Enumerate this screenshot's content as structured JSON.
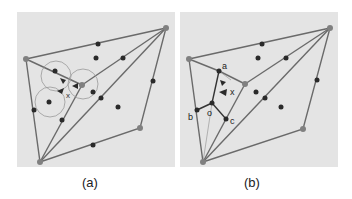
{
  "figure": {
    "background": "#ffffff",
    "panel_bg": "#e4e4e4",
    "line_color": "#6a6a6a",
    "dot_color": "#2a2a2a",
    "vertex_color": "#808080",
    "panels": [
      {
        "id": "a",
        "caption": "(a)",
        "marker_label": "x",
        "circles": [
          [
            56,
            76,
            15
          ],
          [
            83,
            84,
            15
          ],
          [
            50,
            102,
            15
          ]
        ]
      },
      {
        "id": "b",
        "caption": "(b)",
        "point_labels": {
          "a": "a",
          "b": "b",
          "o": "o",
          "c": "c",
          "x": "x"
        }
      }
    ]
  }
}
